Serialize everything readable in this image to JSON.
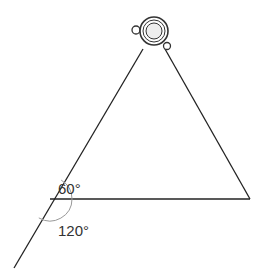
{
  "diagram": {
    "labels": {
      "angle_upper": "60°",
      "angle_lower": "120°"
    },
    "colors": {
      "line": "#222222",
      "arc": "#999999",
      "lamp_fill": "#eeeeee",
      "lamp_stroke": "#333333",
      "text": "#333333"
    }
  }
}
